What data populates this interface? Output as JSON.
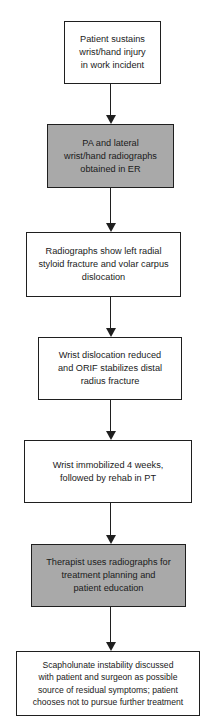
{
  "diagram": {
    "type": "flowchart",
    "direction": "top-to-bottom",
    "colors": {
      "shaded_fill": "#a9a9a9",
      "plain_fill": "#ffffff",
      "stroke": "#1f1f1f"
    },
    "nodes": [
      {
        "id": 1,
        "shaded": false,
        "lines": [
          "Patient sustains",
          "wrist/hand injury",
          "in work incident"
        ]
      },
      {
        "id": 2,
        "shaded": true,
        "lines": [
          "PA and lateral",
          "wrist/hand radiographs",
          "obtained in ER"
        ]
      },
      {
        "id": 3,
        "shaded": false,
        "lines": [
          "Radiographs show left radial",
          "styloid fracture and volar carpus",
          "dislocation"
        ]
      },
      {
        "id": 4,
        "shaded": false,
        "lines": [
          "Wrist dislocation reduced",
          "and ORIF stabilizes distal",
          "radius fracture"
        ]
      },
      {
        "id": 5,
        "shaded": false,
        "lines": [
          "Wrist immobilized 4 weeks,",
          "followed by rehab in PT"
        ]
      },
      {
        "id": 6,
        "shaded": true,
        "lines": [
          "Therapist uses radiographs for",
          "treatment planning and",
          "patient education"
        ]
      },
      {
        "id": 7,
        "shaded": false,
        "lines": [
          "Scapholunate instability discussed",
          "with patient and surgeon as possible",
          "source of residual symptoms; patient",
          "chooses not to pursue further treatment"
        ]
      }
    ],
    "edges": [
      {
        "from": 1,
        "to": 2
      },
      {
        "from": 2,
        "to": 3
      },
      {
        "from": 3,
        "to": 4
      },
      {
        "from": 4,
        "to": 5
      },
      {
        "from": 5,
        "to": 6
      },
      {
        "from": 6,
        "to": 7
      }
    ]
  }
}
